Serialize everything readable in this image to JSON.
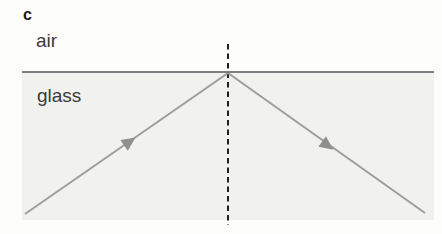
{
  "figure": {
    "panel_label": "c",
    "medium_labels": {
      "top": "air",
      "bottom": "glass"
    },
    "colors": {
      "background": "#fdfdfb",
      "glass_fill": "#f1f1ee",
      "interface_line": "#56565a",
      "normal_line": "#1e1e1e",
      "ray": "#9d9d9d",
      "arrow": "#8f8f8f",
      "text": "#2e2e2e"
    },
    "glass_region": {
      "x": 22,
      "y": 72,
      "w": 412,
      "h": 148
    },
    "interface": {
      "x1": 22,
      "y": 72,
      "x2": 434,
      "y2": 72
    },
    "normal": {
      "x": 228,
      "y1": 44,
      "y2": 225
    },
    "incident_ray": {
      "x1": 25,
      "y1": 214,
      "x2": 228,
      "y2": 73
    },
    "reflected_ray": {
      "x1": 228,
      "y1": 73,
      "x2": 425,
      "y2": 213
    },
    "arrows": [
      {
        "transform": "translate(129,142) rotate(-34.8)"
      },
      {
        "transform": "translate(327,145) rotate(35.4)"
      }
    ]
  }
}
